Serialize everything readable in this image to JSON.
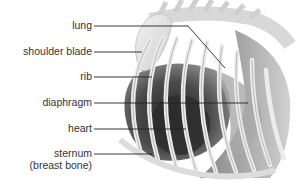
{
  "diagram": {
    "labels": [
      {
        "id": "lung",
        "text": "lung",
        "x_right": 92,
        "y": 26,
        "line": [
          [
            94,
            26
          ],
          [
            188,
            26
          ],
          [
            225,
            68
          ]
        ]
      },
      {
        "id": "shoulder-blade",
        "text": "shoulder blade",
        "x_right": 92,
        "y": 52,
        "line": [
          [
            94,
            52
          ],
          [
            142,
            52
          ]
        ]
      },
      {
        "id": "rib",
        "text": "rib",
        "x_right": 92,
        "y": 77,
        "line": [
          [
            94,
            77
          ],
          [
            152,
            77
          ]
        ]
      },
      {
        "id": "diaphragm",
        "text": "diaphragm",
        "x_right": 92,
        "y": 103,
        "line": [
          [
            94,
            103
          ],
          [
            248,
            103
          ]
        ]
      },
      {
        "id": "heart",
        "text": "heart",
        "x_right": 92,
        "y": 129,
        "line": [
          [
            94,
            129
          ],
          [
            186,
            129
          ]
        ]
      },
      {
        "id": "sternum",
        "text": "sternum",
        "x_right": 92,
        "y": 154,
        "line": [
          [
            94,
            154
          ],
          [
            152,
            154
          ]
        ]
      }
    ],
    "sternum_sublabel": "(breast bone)",
    "colors": {
      "text": "#333333",
      "leader": "#222222",
      "bone": "#e6e6e6",
      "bone_edge": "#a8a8a8",
      "muscle_dark": "#3a3a3a",
      "muscle_mid": "#7a7a7a",
      "muscle_light": "#b5b5b5"
    }
  }
}
